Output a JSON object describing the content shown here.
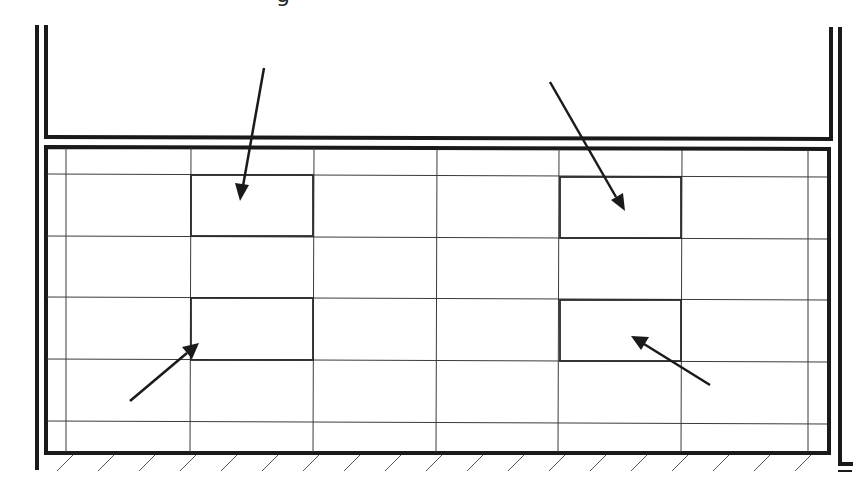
{
  "diagram": {
    "title_fragment": "g",
    "colors": {
      "line": "#1a1a1a",
      "grid": "#3a3a3a",
      "hatch": "#555555",
      "background": "#ffffff"
    },
    "walls": {
      "left_outer_x": 36,
      "left_inner_x": 45,
      "right_inner_x": 831,
      "right_outer_x": 840,
      "top_y": 25,
      "ledge_y": 137
    },
    "panel": {
      "x1": 45,
      "y1": 146,
      "x2": 829,
      "y2": 453
    },
    "grid_columns_x": [
      66,
      191,
      314,
      437,
      559,
      682,
      808
    ],
    "grid_rows_y": [
      175,
      237,
      298,
      360,
      422
    ],
    "highlighted_cells": [
      {
        "id": "cell-top-left",
        "x": 191,
        "y": 175,
        "w": 122,
        "h": 61
      },
      {
        "id": "cell-top-right",
        "x": 560,
        "y": 177,
        "w": 121,
        "h": 61
      },
      {
        "id": "cell-bottom-left",
        "x": 191,
        "y": 298,
        "w": 122,
        "h": 62
      },
      {
        "id": "cell-bottom-right",
        "x": 560,
        "y": 300,
        "w": 121,
        "h": 61
      }
    ],
    "arrows": [
      {
        "id": "arrow-1",
        "from": [
          264,
          68
        ],
        "to": [
          240,
          200
        ]
      },
      {
        "id": "arrow-2",
        "from": [
          550,
          82
        ],
        "to": [
          624,
          210
        ]
      },
      {
        "id": "arrow-3",
        "from": [
          130,
          401
        ],
        "to": [
          198,
          344
        ]
      },
      {
        "id": "arrow-4",
        "from": [
          710,
          385
        ],
        "to": [
          632,
          337
        ]
      }
    ],
    "ground_hatch": {
      "y_top": 455,
      "y_bottom": 471,
      "start_x": 57,
      "spacing": 41,
      "count": 19
    }
  }
}
